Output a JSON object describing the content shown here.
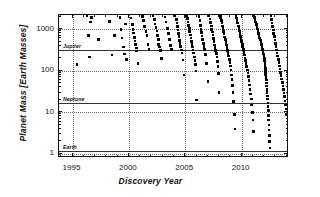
{
  "chart_data": {
    "type": "scatter",
    "title": "",
    "xlabel": "Discovery Year",
    "ylabel": "Planet Mass [Earth Masses]",
    "xlim": [
      1993.8,
      2014.2
    ],
    "ylim": [
      0.8,
      2200
    ],
    "yscale": "log",
    "xscale": "linear",
    "grid": "dotted gridlines at major x and y ticks",
    "legend": "none",
    "xticks": [
      1995,
      2000,
      2005,
      2010
    ],
    "xtick_labels": [
      "1995",
      "2000",
      "2005",
      "2010"
    ],
    "yticks": [
      1,
      10,
      100,
      1000
    ],
    "ytick_labels": [
      "1",
      "10",
      "100",
      "1000"
    ],
    "reference_lines": [
      {
        "label": "Jupiter",
        "value": 318
      },
      {
        "label": "Neptune",
        "value": 17
      },
      {
        "label": "Earth",
        "value": 1.15
      }
    ],
    "points": [
      [
        1995.4,
        140
      ],
      [
        1996.3,
        2100
      ],
      [
        1996.4,
        700
      ],
      [
        1996.5,
        215
      ],
      [
        1996.6,
        1480
      ],
      [
        1996.7,
        1900
      ],
      [
        1997.3,
        560
      ],
      [
        1998.3,
        1550
      ],
      [
        1998.5,
        240
      ],
      [
        1998.7,
        700
      ],
      [
        1999.2,
        1900
      ],
      [
        1999.3,
        1000
      ],
      [
        1999.4,
        620
      ],
      [
        1999.5,
        370
      ],
      [
        1999.6,
        255
      ],
      [
        1999.7,
        1350
      ],
      [
        1999.8,
        190
      ],
      [
        2000.2,
        1850
      ],
      [
        2000.3,
        1300
      ],
      [
        2000.35,
        980
      ],
      [
        2000.4,
        820
      ],
      [
        2000.5,
        640
      ],
      [
        2000.55,
        520
      ],
      [
        2000.6,
        430
      ],
      [
        2000.65,
        350
      ],
      [
        2000.7,
        300
      ],
      [
        2000.8,
        150
      ],
      [
        2001.2,
        2000
      ],
      [
        2001.3,
        1600
      ],
      [
        2001.4,
        1150
      ],
      [
        2001.5,
        870
      ],
      [
        2001.6,
        700
      ],
      [
        2001.7,
        430
      ],
      [
        2001.8,
        330
      ],
      [
        2002.15,
        2100
      ],
      [
        2002.25,
        1700
      ],
      [
        2002.3,
        1350
      ],
      [
        2002.4,
        1100
      ],
      [
        2002.5,
        900
      ],
      [
        2002.55,
        700
      ],
      [
        2002.6,
        560
      ],
      [
        2002.65,
        430
      ],
      [
        2002.7,
        370
      ],
      [
        2002.8,
        310
      ],
      [
        2002.9,
        200
      ],
      [
        2003.2,
        1950
      ],
      [
        2003.3,
        1500
      ],
      [
        2003.4,
        1050
      ],
      [
        2003.5,
        780
      ],
      [
        2003.6,
        560
      ],
      [
        2003.7,
        400
      ],
      [
        2003.8,
        330
      ],
      [
        2004.1,
        2100
      ],
      [
        2004.2,
        1700
      ],
      [
        2004.25,
        1400
      ],
      [
        2004.3,
        1150
      ],
      [
        2004.35,
        950
      ],
      [
        2004.4,
        800
      ],
      [
        2004.45,
        660
      ],
      [
        2004.5,
        540
      ],
      [
        2004.55,
        450
      ],
      [
        2004.6,
        380
      ],
      [
        2004.65,
        320
      ],
      [
        2004.7,
        270
      ],
      [
        2004.8,
        180
      ],
      [
        2004.9,
        80
      ],
      [
        2005.1,
        2100
      ],
      [
        2005.2,
        1800
      ],
      [
        2005.25,
        1500
      ],
      [
        2005.3,
        1250
      ],
      [
        2005.35,
        1050
      ],
      [
        2005.4,
        880
      ],
      [
        2005.45,
        730
      ],
      [
        2005.5,
        610
      ],
      [
        2005.55,
        510
      ],
      [
        2005.6,
        430
      ],
      [
        2005.65,
        370
      ],
      [
        2005.7,
        320
      ],
      [
        2005.75,
        270
      ],
      [
        2005.8,
        215
      ],
      [
        2005.85,
        175
      ],
      [
        2005.9,
        140
      ],
      [
        2005.95,
        100
      ],
      [
        2006.0,
        20
      ],
      [
        2006.2,
        2050
      ],
      [
        2006.3,
        1600
      ],
      [
        2006.35,
        1250
      ],
      [
        2006.4,
        1000
      ],
      [
        2006.45,
        830
      ],
      [
        2006.5,
        680
      ],
      [
        2006.55,
        560
      ],
      [
        2006.6,
        460
      ],
      [
        2006.65,
        390
      ],
      [
        2006.7,
        330
      ],
      [
        2006.8,
        250
      ],
      [
        2006.9,
        150
      ],
      [
        2007.0,
        55
      ],
      [
        2007.1,
        2100
      ],
      [
        2007.2,
        1750
      ],
      [
        2007.25,
        1450
      ],
      [
        2007.3,
        1200
      ],
      [
        2007.35,
        1000
      ],
      [
        2007.4,
        850
      ],
      [
        2007.45,
        720
      ],
      [
        2007.5,
        600
      ],
      [
        2007.55,
        500
      ],
      [
        2007.6,
        420
      ],
      [
        2007.65,
        360
      ],
      [
        2007.7,
        310
      ],
      [
        2007.75,
        260
      ],
      [
        2007.8,
        215
      ],
      [
        2007.85,
        170
      ],
      [
        2007.9,
        125
      ],
      [
        2007.95,
        85
      ],
      [
        2008.0,
        30
      ],
      [
        2008.1,
        2150
      ],
      [
        2008.15,
        1850
      ],
      [
        2008.2,
        1600
      ],
      [
        2008.25,
        1400
      ],
      [
        2008.3,
        1200
      ],
      [
        2008.35,
        1030
      ],
      [
        2008.4,
        890
      ],
      [
        2008.45,
        760
      ],
      [
        2008.5,
        650
      ],
      [
        2008.55,
        560
      ],
      [
        2008.6,
        480
      ],
      [
        2008.65,
        415
      ],
      [
        2008.7,
        360
      ],
      [
        2008.75,
        310
      ],
      [
        2008.8,
        265
      ],
      [
        2008.85,
        225
      ],
      [
        2008.9,
        190
      ],
      [
        2008.95,
        160
      ],
      [
        2009.0,
        130
      ],
      [
        2009.05,
        105
      ],
      [
        2009.1,
        80
      ],
      [
        2009.15,
        62
      ],
      [
        2009.2,
        45
      ],
      [
        2009.25,
        30
      ],
      [
        2009.3,
        18
      ],
      [
        2009.35,
        9
      ],
      [
        2009.4,
        4
      ],
      [
        2009.5,
        2150
      ],
      [
        2009.55,
        1850
      ],
      [
        2009.6,
        1600
      ],
      [
        2009.65,
        1400
      ],
      [
        2009.7,
        1200
      ],
      [
        2009.75,
        1050
      ],
      [
        2009.8,
        900
      ],
      [
        2009.85,
        780
      ],
      [
        2009.9,
        670
      ],
      [
        2009.95,
        580
      ],
      [
        2010.0,
        500
      ],
      [
        2010.05,
        430
      ],
      [
        2010.1,
        375
      ],
      [
        2010.15,
        325
      ],
      [
        2010.2,
        280
      ],
      [
        2010.25,
        240
      ],
      [
        2010.3,
        205
      ],
      [
        2010.35,
        175
      ],
      [
        2010.4,
        150
      ],
      [
        2010.45,
        125
      ],
      [
        2010.5,
        105
      ],
      [
        2010.55,
        88
      ],
      [
        2010.6,
        72
      ],
      [
        2010.65,
        58
      ],
      [
        2010.7,
        46
      ],
      [
        2010.75,
        36
      ],
      [
        2010.8,
        28
      ],
      [
        2010.85,
        21
      ],
      [
        2010.9,
        15
      ],
      [
        2010.95,
        10
      ],
      [
        2011.0,
        6.5
      ],
      [
        2011.05,
        3.5
      ],
      [
        2011.1,
        2150
      ],
      [
        2011.15,
        1900
      ],
      [
        2011.2,
        1680
      ],
      [
        2011.25,
        1480
      ],
      [
        2011.3,
        1300
      ],
      [
        2011.35,
        1150
      ],
      [
        2011.4,
        1020
      ],
      [
        2011.45,
        900
      ],
      [
        2011.5,
        790
      ],
      [
        2011.55,
        700
      ],
      [
        2011.6,
        620
      ],
      [
        2011.65,
        545
      ],
      [
        2011.7,
        480
      ],
      [
        2011.75,
        425
      ],
      [
        2011.8,
        375
      ],
      [
        2011.85,
        330
      ],
      [
        2011.9,
        290
      ],
      [
        2011.95,
        255
      ],
      [
        2012.0,
        225
      ],
      [
        2012.02,
        198
      ],
      [
        2012.04,
        172
      ],
      [
        2012.06,
        150
      ],
      [
        2012.08,
        130
      ],
      [
        2012.1,
        112
      ],
      [
        2012.12,
        96
      ],
      [
        2012.14,
        82
      ],
      [
        2012.16,
        70
      ],
      [
        2012.18,
        60
      ],
      [
        2012.2,
        51
      ],
      [
        2012.22,
        43
      ],
      [
        2012.24,
        36
      ],
      [
        2012.26,
        30
      ],
      [
        2012.28,
        25
      ],
      [
        2012.3,
        21
      ],
      [
        2012.32,
        17
      ],
      [
        2012.34,
        14
      ],
      [
        2012.36,
        11
      ],
      [
        2012.38,
        8.5
      ],
      [
        2012.4,
        6.5
      ],
      [
        2012.42,
        5
      ],
      [
        2012.44,
        3.8
      ],
      [
        2012.46,
        2.8
      ],
      [
        2012.48,
        2.0
      ],
      [
        2012.5,
        1.4
      ],
      [
        2012.6,
        2100
      ],
      [
        2012.65,
        1700
      ],
      [
        2012.7,
        1400
      ],
      [
        2012.75,
        1150
      ],
      [
        2012.8,
        950
      ],
      [
        2012.85,
        790
      ],
      [
        2012.9,
        660
      ],
      [
        2012.95,
        550
      ],
      [
        2013.0,
        460
      ],
      [
        2013.05,
        385
      ],
      [
        2013.1,
        320
      ],
      [
        2013.15,
        270
      ],
      [
        2013.2,
        225
      ],
      [
        2013.25,
        190
      ],
      [
        2013.3,
        158
      ],
      [
        2013.35,
        132
      ],
      [
        2013.4,
        110
      ],
      [
        2013.45,
        92
      ],
      [
        2013.5,
        76
      ],
      [
        2013.55,
        63
      ],
      [
        2013.6,
        52
      ],
      [
        2013.65,
        43
      ],
      [
        2013.7,
        35
      ],
      [
        2013.75,
        29
      ],
      [
        2013.8,
        24
      ],
      [
        2013.85,
        19
      ],
      [
        2013.9,
        15
      ],
      [
        2013.95,
        12
      ],
      [
        2014.0,
        9
      ]
    ]
  },
  "colors": {
    "point": "#000000",
    "axis": "#111111",
    "grid": "#6a6a6a",
    "refline": "#333333",
    "background": "#ffffff"
  }
}
